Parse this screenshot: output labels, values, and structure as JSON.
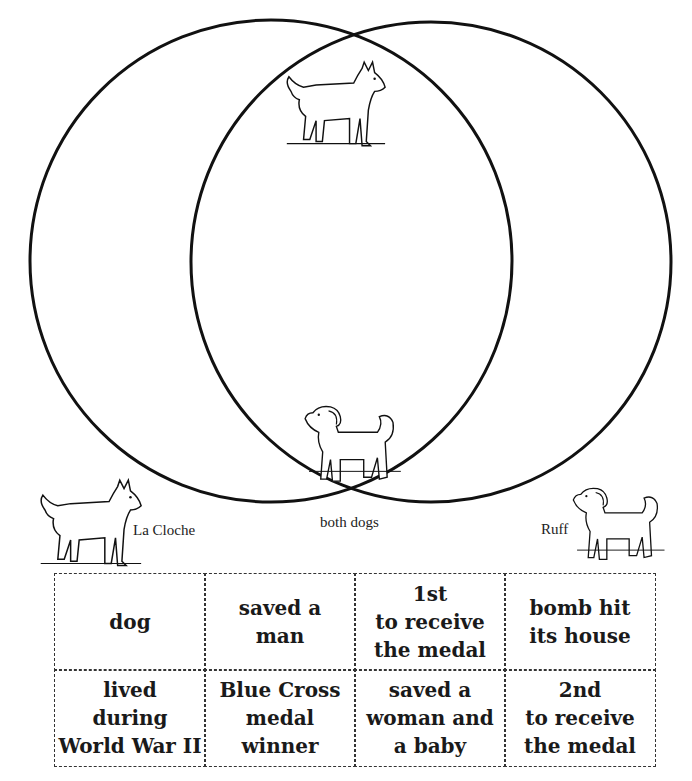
{
  "venn": {
    "left_label": "La Cloche",
    "right_label": "Ruff",
    "overlap_label": "both dogs",
    "stroke_color": "#111111"
  },
  "dogs": [
    {
      "name": "La Cloche",
      "type": "husky",
      "location": "overlap-top"
    },
    {
      "name": "Ruff",
      "type": "fluffy-puppy",
      "location": "overlap-bottom"
    },
    {
      "name": "La Cloche",
      "type": "husky",
      "location": "below-left"
    },
    {
      "name": "Ruff",
      "type": "fluffy-puppy",
      "location": "below-right"
    }
  ],
  "cards": [
    {
      "text": "dog"
    },
    {
      "text": "saved a\nman"
    },
    {
      "text": "1st\nto receive\nthe medal"
    },
    {
      "text": "bomb hit\nits house"
    },
    {
      "text": "lived\nduring\nWorld War II"
    },
    {
      "text": "Blue Cross\nmedal\nwinner"
    },
    {
      "text": "saved a\nwoman and\na baby"
    },
    {
      "text": "2nd\nto receive\nthe medal"
    }
  ]
}
